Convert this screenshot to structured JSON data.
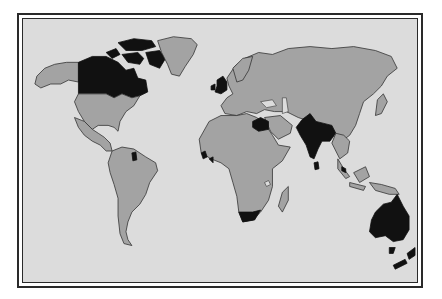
{
  "map": {
    "title": "World map highlighting British Commonwealth dominions",
    "colors": {
      "ocean": "#dcdcdc",
      "land": "#a3a3a3",
      "highlighted": "#111111",
      "border": "#2a2a2a"
    },
    "highlighted_regions": [
      "Canada",
      "United Kingdom",
      "Guyana",
      "Gambia / Sierra Leone (West Africa)",
      "Libya/Egypt region",
      "South Africa",
      "India",
      "Sri Lanka",
      "Malaysia",
      "Australia",
      "New Zealand",
      "Tasmania"
    ],
    "legend": null
  }
}
